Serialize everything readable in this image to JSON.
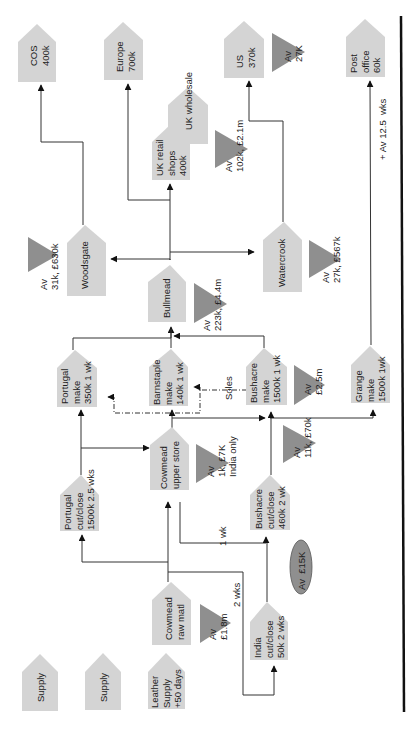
{
  "diagram": {
    "type": "value-stream-map",
    "orientation": "rotated 90deg counter-clockwise",
    "colors": {
      "node_fill": "#d4d4d4",
      "inventory_fill": "#8f8f8f",
      "line": "#333333",
      "border": "#111111"
    },
    "nodes": {
      "cos": {
        "label": "COS\n400k"
      },
      "europe": {
        "label": "Europe\n700k"
      },
      "uk_wholesale": {
        "label": "UK wholesale"
      },
      "uk_retail": {
        "label": "UK retail\nshops\n400k"
      },
      "us": {
        "label": "US\n370k"
      },
      "post_office": {
        "label": "Post\noffice\n60k"
      },
      "woodsgate": {
        "label": "Woodsgate"
      },
      "bullmead": {
        "label": "Bullmead"
      },
      "watercrook": {
        "label": "Watercrook"
      },
      "portugal_make": {
        "label": "Portugal\nmake\n350k 1 wk"
      },
      "barnstaple_make": {
        "label": "Barnstaple\nmake\n140k 1 wk"
      },
      "bushacre_make": {
        "label": "Bushacre\nmake\n1500k 1 wk"
      },
      "grange_make": {
        "label": "Grange\nmake\n1500k 1wk"
      },
      "portugal_cutclose": {
        "label": "Portugal\ncut/close\n1500k 2.5 wks"
      },
      "cowmead_upper": {
        "label": "Cowmead\nupper store"
      },
      "bushacre_cutclose": {
        "label": "Bushacre\ncut/close\n460k 2 wk"
      },
      "cowmead_raw": {
        "label": "Cowmead\nraw matl"
      },
      "india_cutclose": {
        "label": "India\ncut/close\n50k 2 wks"
      },
      "supply_1": {
        "label": "Supply"
      },
      "supply_2": {
        "label": "Supply"
      },
      "leather_supply": {
        "label": "Leather\nSupply\n+50 days"
      }
    },
    "inventories": {
      "inv_woodsgate": {
        "label": "Av\n31k, £630k"
      },
      "inv_uk": {
        "label": "Av\n102k, £2.1m"
      },
      "inv_us": {
        "label": "Av\n27K"
      },
      "inv_bullmead": {
        "label": "Av\n223k, £4.4m"
      },
      "inv_watercrook": {
        "label": "Av\n27k, £567k"
      },
      "inv_bushacre_make": {
        "label": "Av\n£2.5m"
      },
      "inv_cowmead_upper": {
        "label": "Av\n1k, £7K\nIndia only"
      },
      "inv_bushacre_cut": {
        "label": "Av\n11k, £70k"
      },
      "inv_cowmead_raw": {
        "label": "Av\n£1.8m"
      },
      "inv_india": {
        "label": "Av  £15K"
      }
    },
    "annotations": {
      "soles": "Soles",
      "one_wk": "1 wk",
      "two_wks": "2 wks",
      "post_lead": "+ Av 12.5  wks"
    }
  }
}
